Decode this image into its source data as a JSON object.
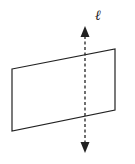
{
  "diagram": {
    "line_label": "ℓ",
    "plane": {
      "points": [
        [
          12,
          69
        ],
        [
          115,
          49
        ],
        [
          115,
          110
        ],
        [
          12,
          131
        ]
      ],
      "stroke": "#222222"
    },
    "line": {
      "x": 85,
      "y_top": 26,
      "y_bottom": 152,
      "stroke": "#222222",
      "dashed": true,
      "arrows": "both"
    }
  }
}
